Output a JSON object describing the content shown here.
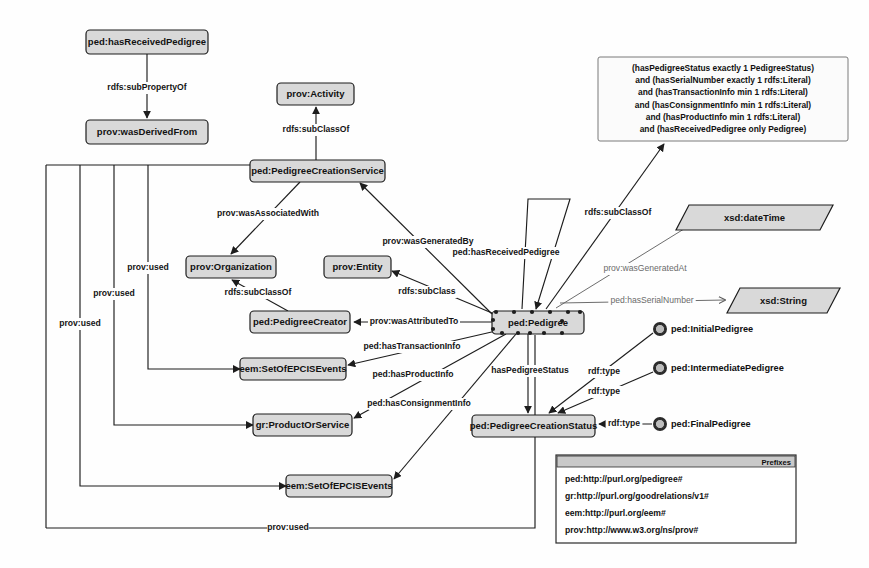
{
  "diagram": {
    "background_color": "#fefefe",
    "node_fill": "#d9d9d9",
    "node_stroke": "#1d1d1d"
  },
  "nodes": {
    "hasReceivedPedigreeProp": {
      "label": "ped:hasReceivedPedigree",
      "x": 86,
      "y": 30,
      "w": 122,
      "h": 24,
      "shape": "rect"
    },
    "wasDerivedFrom": {
      "label": "prov:wasDerivedFrom",
      "x": 86,
      "y": 120,
      "w": 122,
      "h": 24,
      "shape": "rect"
    },
    "provActivity": {
      "label": "prov:Activity",
      "x": 277,
      "y": 83,
      "w": 77,
      "h": 22,
      "shape": "rect"
    },
    "pedigreeCreationService": {
      "label": "ped:PedigreeCreationService",
      "x": 250,
      "y": 160,
      "w": 135,
      "h": 22,
      "shape": "rect"
    },
    "provOrganization": {
      "label": "prov:Organization",
      "x": 186,
      "y": 256,
      "w": 90,
      "h": 22,
      "shape": "rect"
    },
    "provEntity": {
      "label": "prov:Entity",
      "x": 324,
      "y": 256,
      "w": 67,
      "h": 22,
      "shape": "rect"
    },
    "pedigreeCreator": {
      "label": "ped:PedigreeCreator",
      "x": 250,
      "y": 311,
      "w": 100,
      "h": 22,
      "shape": "rect"
    },
    "setOfEpcisEvents1": {
      "label": "eem:SetOfEPCISEvents",
      "x": 240,
      "y": 358,
      "w": 106,
      "h": 22,
      "shape": "rect"
    },
    "productOrService": {
      "label": "gr:ProductOrService",
      "x": 253,
      "y": 414,
      "w": 99,
      "h": 22,
      "shape": "rect"
    },
    "setOfEpcisEvents2": {
      "label": "eem:SetOfEPCISEvents",
      "x": 286,
      "y": 475,
      "w": 106,
      "h": 22,
      "shape": "rect"
    },
    "pedigree": {
      "label": "ped:Pedigree",
      "x": 492,
      "y": 311,
      "w": 92,
      "h": 23,
      "shape": "rect"
    },
    "pedigreeCreationStatus": {
      "label": "ped:PedigreeCreationStatus",
      "x": 472,
      "y": 415,
      "w": 123,
      "h": 22,
      "shape": "rect"
    },
    "xsdDateTime": {
      "label": "xsd:dateTime",
      "x": 676,
      "y": 205,
      "w": 157,
      "h": 25,
      "shape": "parallelogram"
    },
    "xsdString": {
      "label": "xsd:String",
      "x": 727,
      "y": 288,
      "w": 113,
      "h": 25,
      "shape": "parallelogram"
    }
  },
  "individuals": [
    {
      "label": "ped:InitialPedigree",
      "cx": 660,
      "cy": 329,
      "r": 7
    },
    {
      "label": "ped:IntermediatePedigree",
      "cx": 660,
      "cy": 368,
      "r": 7
    },
    {
      "label": "ped:FinalPedigree",
      "cx": 660,
      "cy": 424,
      "r": 7
    }
  ],
  "restriction": {
    "x": 598,
    "y": 57,
    "w": 250,
    "h": 84,
    "lines": [
      "(hasPedigreeStatus exactly 1 PedigreeStatus)",
      "and (hasSerialNumber exactly 1 rdfs:Literal)",
      "and (hasTransactionInfo min 1 rdfs:Literal)",
      "and (hasConsignmentInfo min 1 rdfs:Literal)",
      "and (hasProductInfo min 1 rdfs:Literal)",
      "and (hasReceivedPedigree only Pedigree)"
    ]
  },
  "edge_labels": [
    {
      "id": "subPropertyOf",
      "text": "rdfs:subPropertyOf",
      "x": 147,
      "y": 88,
      "dim": false
    },
    {
      "id": "subClassOfActivity",
      "text": "rdfs:subClassOf",
      "x": 316,
      "y": 130,
      "dim": false
    },
    {
      "id": "wasAssociatedWith",
      "text": "prov:wasAssociatedWith",
      "x": 268,
      "y": 214,
      "dim": false
    },
    {
      "id": "wasGeneratedBy",
      "text": "prov:wasGeneratedBy",
      "x": 428,
      "y": 242,
      "dim": false
    },
    {
      "id": "subClassOfOrg",
      "text": "rdfs:subClassOf",
      "x": 258,
      "y": 293,
      "dim": false
    },
    {
      "id": "subClassEntity",
      "text": "rdfs:subClass",
      "x": 427,
      "y": 292,
      "dim": false
    },
    {
      "id": "wasAttributedTo",
      "text": "prov:wasAttributedTo",
      "x": 414,
      "y": 322,
      "dim": false
    },
    {
      "id": "hasTransactionInfo",
      "text": "ped:hasTransactionInfo",
      "x": 412,
      "y": 347,
      "dim": false
    },
    {
      "id": "hasProductInfo",
      "text": "ped:hasProductInfo",
      "x": 413,
      "y": 375,
      "dim": false
    },
    {
      "id": "hasConsignmentInfo",
      "text": "ped:hasConsignmentInfo",
      "x": 419,
      "y": 404,
      "dim": false
    },
    {
      "id": "hasPedigreeStatus",
      "text": "hasPedigreeStatus",
      "x": 530,
      "y": 371,
      "dim": false
    },
    {
      "id": "hasReceivedPedigree",
      "text": "ped:hasReceivedPedigree",
      "x": 506,
      "y": 253,
      "dim": false
    },
    {
      "id": "subClassOfRestr",
      "text": "rdfs:subClassOf",
      "x": 618,
      "y": 213,
      "dim": false
    },
    {
      "id": "wasGeneratedAt",
      "text": "prov:wasGeneratedAt",
      "x": 645,
      "y": 269,
      "dim": true
    },
    {
      "id": "hasSerialNumber",
      "text": "ped:hasSerialNumber",
      "x": 652,
      "y": 301,
      "dim": true
    },
    {
      "id": "rdfTypeInitial",
      "text": "rdf:type",
      "x": 604,
      "y": 372,
      "dim": false
    },
    {
      "id": "rdfTypeIntermediate",
      "text": "rdf:type",
      "x": 604,
      "y": 392,
      "dim": false
    },
    {
      "id": "rdfTypeFinal",
      "text": "rdf:type",
      "x": 624,
      "y": 424,
      "dim": false
    },
    {
      "id": "provUsed1",
      "text": "prov:used",
      "x": 80,
      "y": 324,
      "dim": false
    },
    {
      "id": "provUsed2",
      "text": "prov:used",
      "x": 114,
      "y": 294,
      "dim": false
    },
    {
      "id": "provUsed3",
      "text": "prov:used",
      "x": 148,
      "y": 268,
      "dim": false
    },
    {
      "id": "provUsed4",
      "text": "prov:used",
      "x": 288,
      "y": 528,
      "dim": false
    }
  ],
  "legend": {
    "title": "Prefixes",
    "x": 556,
    "y": 455,
    "w": 240,
    "h": 88,
    "entries": [
      "ped:http://purl.org/pedigree#",
      "gr:http://purl.org/goodrelations/v1#",
      "eem:http://purl.org/eem#",
      "prov:http://www.w3.org/ns/prov#"
    ]
  }
}
